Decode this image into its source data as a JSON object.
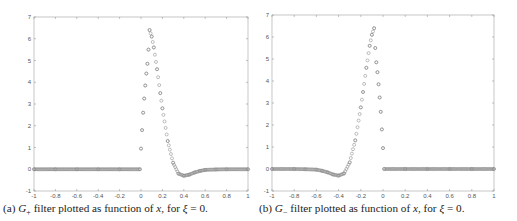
{
  "figures": [
    {
      "id": "a",
      "caption": {
        "prefix": "(a)",
        "symbol": "G",
        "subscript": "+",
        "text_1": " filter plotted as function of ",
        "var": "x",
        "text_2": ", for ",
        "greek": "ξ",
        "text_3": " = 0."
      }
    },
    {
      "id": "b",
      "caption": {
        "prefix": "(b)",
        "symbol": "G",
        "subscript": "−",
        "text_1": " filter plotted as function of ",
        "var": "x",
        "text_2": ", for ",
        "greek": "ξ",
        "text_3": " = 0."
      }
    }
  ],
  "chart_data": [
    {
      "type": "scatter",
      "title": "",
      "caption": "(a) G+ filter plotted as function of x, for ξ = 0.",
      "xlabel": "",
      "ylabel": "",
      "xlim": [
        -1,
        1
      ],
      "ylim": [
        -1,
        7
      ],
      "xticks": [
        "-1",
        "-0.8",
        "-0.6",
        "-0.4",
        "-0.2",
        "0",
        "0.2",
        "0.4",
        "0.6",
        "0.8",
        "1"
      ],
      "yticks": [
        "-1",
        "0",
        "1",
        "2",
        "3",
        "4",
        "5",
        "6",
        "7"
      ],
      "grid": false,
      "legend": null,
      "marker": "open circle",
      "series": [
        {
          "name": "G+",
          "x": [
            -1.0,
            -0.8,
            -0.6,
            -0.4,
            -0.2,
            -0.01,
            0.0,
            0.01,
            0.02,
            0.03,
            0.04,
            0.05,
            0.06,
            0.07,
            0.08,
            0.1,
            0.12,
            0.15,
            0.18,
            0.2,
            0.25,
            0.3,
            0.35,
            0.4,
            0.45,
            0.5,
            0.55,
            0.6,
            0.7,
            0.8,
            1.0
          ],
          "y": [
            0,
            0,
            0,
            0,
            0,
            0,
            0.95,
            1.8,
            2.6,
            3.25,
            3.85,
            4.4,
            4.85,
            5.5,
            6.4,
            6.1,
            5.6,
            4.6,
            3.5,
            2.8,
            1.3,
            0.3,
            -0.2,
            -0.3,
            -0.25,
            -0.15,
            -0.08,
            -0.03,
            -0.01,
            0,
            0
          ]
        }
      ]
    },
    {
      "type": "scatter",
      "title": "",
      "caption": "(b) G− filter plotted as function of x, for ξ = 0.",
      "xlabel": "",
      "ylabel": "",
      "xlim": [
        -1,
        1
      ],
      "ylim": [
        -1,
        7
      ],
      "xticks": [
        "-1",
        "-0.8",
        "-0.6",
        "-0.4",
        "-0.2",
        "0",
        "0.2",
        "0.4",
        "0.6",
        "0.8",
        "1"
      ],
      "yticks": [
        "-1",
        "0",
        "1",
        "2",
        "3",
        "4",
        "5",
        "6",
        "7"
      ],
      "grid": false,
      "legend": null,
      "marker": "open circle",
      "series": [
        {
          "name": "G−",
          "x": [
            -1.0,
            -0.8,
            -0.7,
            -0.6,
            -0.55,
            -0.5,
            -0.45,
            -0.4,
            -0.35,
            -0.3,
            -0.25,
            -0.2,
            -0.18,
            -0.15,
            -0.12,
            -0.1,
            -0.08,
            -0.07,
            -0.06,
            -0.05,
            -0.04,
            -0.03,
            -0.02,
            -0.01,
            0.0,
            0.01,
            0.2,
            0.4,
            0.6,
            0.8,
            1.0
          ],
          "y": [
            0,
            0,
            -0.01,
            -0.03,
            -0.08,
            -0.15,
            -0.25,
            -0.3,
            -0.2,
            0.3,
            1.3,
            2.8,
            3.5,
            4.6,
            5.6,
            6.1,
            6.4,
            5.5,
            4.85,
            4.4,
            3.85,
            3.25,
            2.6,
            1.8,
            0.95,
            0,
            0,
            0,
            0,
            0,
            0
          ]
        }
      ]
    }
  ]
}
